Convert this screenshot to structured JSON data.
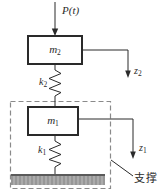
{
  "diagram": {
    "title_semantic": "two-degree-of-freedom mass-spring vibration system",
    "force_label": "P(t)",
    "masses": {
      "top": {
        "symbol": "m",
        "sub": "2"
      },
      "bottom": {
        "symbol": "m",
        "sub": "1"
      }
    },
    "springs": {
      "top": {
        "symbol": "k",
        "sub": "2"
      },
      "bottom": {
        "symbol": "k",
        "sub": "1"
      }
    },
    "displacements": {
      "top": {
        "symbol": "z",
        "sub": "2"
      },
      "bottom": {
        "symbol": "z",
        "sub": "1"
      }
    },
    "support_label": "支撑",
    "colors": {
      "line": "#2a2a2a",
      "dashed": "#8a8a8a",
      "ground-light": "#ababab",
      "ground-dark": "#979797",
      "ground-edge": "#5a5a5a"
    }
  }
}
